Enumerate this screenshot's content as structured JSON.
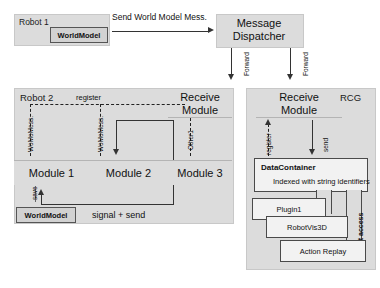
{
  "robot1": {
    "panel_label": "Robot 1",
    "world_model_label": "WorldModel"
  },
  "top_arrow": {
    "label": "Send World Model Mess."
  },
  "dispatcher": {
    "title_line1": "Message",
    "title_line2": "Dispatcher",
    "forward_left": "Forward",
    "forward_right": "Forward"
  },
  "robot2": {
    "panel_label": "Robot 2",
    "register_label": "register",
    "womomess_1": "WoMoMess.",
    "womomess_2": "WoMoMess.",
    "other1_label": "Other1",
    "modules": [
      {
        "label": "Module 1"
      },
      {
        "label": "Module 2"
      },
      {
        "label": "Module 3"
      }
    ],
    "receive_module_line1": "Receive",
    "receive_module_line2": "Module",
    "save_label": "save",
    "world_model_label": "WorldModel",
    "signal_send_label": "signal + send"
  },
  "rcg": {
    "panel_label": "RCG",
    "receive_module_line1": "Receive",
    "receive_module_line2": "Module",
    "register_label": "register",
    "send_label": "send",
    "direct_access_label": "direct access",
    "data_container": {
      "title": "DataContainer",
      "subtitle": "Indexed with string identifiers"
    },
    "plugins": [
      {
        "label": "Plugin1"
      },
      {
        "label": "RobotVis3D"
      },
      {
        "label": "Action Replay"
      }
    ]
  },
  "colors": {
    "panel_fill": "#dcdcdc",
    "box_fill": "#f2f2f2",
    "stroke": "#333333",
    "page_bg": "#ffffff"
  }
}
